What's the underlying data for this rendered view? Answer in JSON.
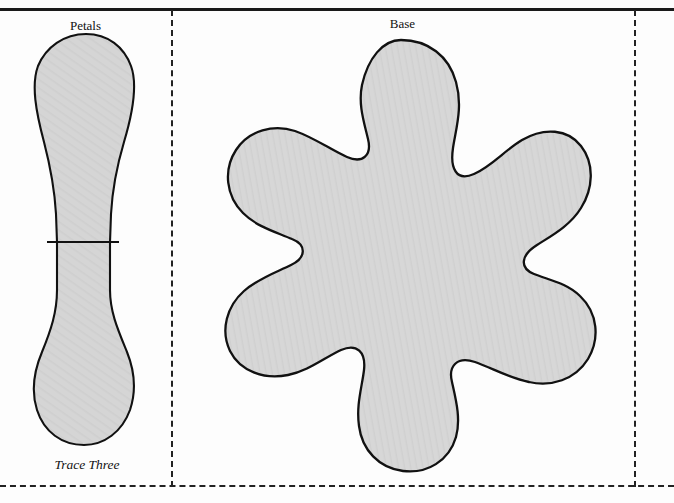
{
  "page": {
    "width": 674,
    "height": 503,
    "background_color": "#fdfdfd",
    "kind": "craft-pattern-template"
  },
  "labels": {
    "petals": "Petals",
    "base": "Base",
    "trace_three": "Trace Three"
  },
  "style": {
    "shape_fill": "#d5d5d5",
    "shape_stroke": "#111111",
    "rule_color": "#1a1a1a",
    "dash_color": "#222222"
  },
  "guides": {
    "top_rule_y": 8,
    "dashed_vertical_left_x": 171,
    "dashed_vertical_right_x": 634,
    "dashed_bottom_y": 485
  },
  "shapes": {
    "petals": {
      "name": "petals-piece",
      "label": "Petals",
      "note": "Trace Three",
      "fill": "#d5d5d5",
      "stroke": "#111111",
      "divider_line": {
        "y": 242,
        "x1": 47,
        "x2": 119
      },
      "path": "M 86 34 C 108 34 124 47 131 66 C 138 85 133 112 124 142 C 116 169 112 196 111 214 L 110 242 L 110 290 C 110 312 118 330 127 352 C 135 372 136 392 130 410 C 122 432 104 445 84 445 C 62 445 44 432 37 410 C 31 391 34 371 42 352 C 51 330 57 312 57 290 L 57 242 L 56 214 C 55 196 51 169 44 142 C 36 112 31 85 38 66 C 46 47 64 34 86 34 Z"
    },
    "base": {
      "name": "base-piece",
      "label": "Base",
      "fill": "#d5d5d5",
      "stroke": "#111111",
      "path": "M 401 40 C 428 40 449 56 456 82 C 463 107 456 128 453 148 C 450 168 456 182 474 174 C 492 166 505 150 522 140 C 544 127 568 129 581 146 C 595 164 593 189 581 208 C 570 226 551 236 537 245 C 521 255 519 268 534 274 C 549 280 567 283 580 296 C 598 313 600 339 588 359 C 575 380 551 387 529 382 C 509 378 492 368 475 362 C 457 356 448 366 452 382 C 456 400 461 419 456 437 C 449 461 427 474 403 471 C 379 468 362 450 359 426 C 356 405 362 387 364 370 C 366 352 357 343 341 350 C 324 358 308 371 288 375 C 264 380 240 371 230 351 C 220 330 227 306 244 291 C 259 278 277 272 291 265 C 306 258 307 245 292 239 C 276 232 257 227 243 213 C 226 196 223 170 236 150 C 249 130 274 124 295 131 C 315 138 331 150 347 157 C 363 164 372 155 368 139 C 364 122 358 104 362 85 C 368 58 383 40 401 40 Z"
    }
  }
}
